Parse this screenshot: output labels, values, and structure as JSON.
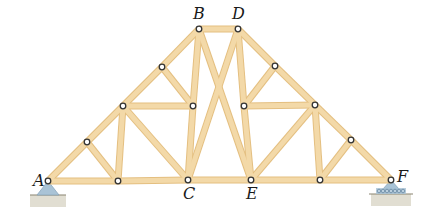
{
  "figure": {
    "type": "truss",
    "colors": {
      "member_fill": "#f3d9a8",
      "member_edge": "#e4bf80",
      "pin_stroke": "#333333",
      "pin_fill": "#ffffff",
      "support_fill": "#a9c3d6",
      "ground": "#c9c3ad",
      "roller": "#6f8ea8"
    },
    "labels": [
      {
        "id": "A",
        "text": "A",
        "x": 33,
        "y": 173
      },
      {
        "id": "B",
        "text": "B",
        "x": 193,
        "y": 6
      },
      {
        "id": "D",
        "text": "D",
        "x": 232,
        "y": 6
      },
      {
        "id": "C",
        "text": "C",
        "x": 183,
        "y": 186
      },
      {
        "id": "E",
        "text": "E",
        "x": 246,
        "y": 186
      },
      {
        "id": "F",
        "text": "F",
        "x": 397,
        "y": 169
      }
    ],
    "nodes": {
      "A": [
        48,
        181
      ],
      "n1": [
        87,
        142
      ],
      "n2": [
        123,
        106
      ],
      "n3": [
        162,
        67
      ],
      "B": [
        199,
        29
      ],
      "D": [
        238,
        29
      ],
      "n4": [
        275,
        66
      ],
      "n5": [
        315,
        105
      ],
      "n6": [
        351,
        140
      ],
      "F": [
        391,
        180
      ],
      "m1": [
        193,
        106
      ],
      "m2": [
        244,
        106
      ],
      "b1": [
        118,
        181
      ],
      "C": [
        188,
        180
      ],
      "E": [
        251,
        180
      ],
      "b2": [
        320,
        180
      ]
    },
    "members": [
      [
        "A",
        "n1"
      ],
      [
        "n1",
        "n2"
      ],
      [
        "n2",
        "n3"
      ],
      [
        "n3",
        "B"
      ],
      [
        "B",
        "D"
      ],
      [
        "D",
        "n4"
      ],
      [
        "n4",
        "n5"
      ],
      [
        "n5",
        "n6"
      ],
      [
        "n6",
        "F"
      ],
      [
        "A",
        "b1"
      ],
      [
        "b1",
        "C"
      ],
      [
        "C",
        "E"
      ],
      [
        "E",
        "b2"
      ],
      [
        "b2",
        "F"
      ],
      [
        "n1",
        "b1"
      ],
      [
        "n2",
        "b1"
      ],
      [
        "n2",
        "C"
      ],
      [
        "n2",
        "m1"
      ],
      [
        "n3",
        "m1"
      ],
      [
        "B",
        "m1"
      ],
      [
        "m1",
        "C"
      ],
      [
        "B",
        "E"
      ],
      [
        "D",
        "C"
      ],
      [
        "D",
        "m2"
      ],
      [
        "m2",
        "E"
      ],
      [
        "n4",
        "m2"
      ],
      [
        "m2",
        "n5"
      ],
      [
        "n5",
        "E"
      ],
      [
        "n5",
        "b2"
      ],
      [
        "n6",
        "b2"
      ]
    ],
    "supports": [
      {
        "id": "support-A",
        "kind": "pin",
        "node": "A"
      },
      {
        "id": "support-F",
        "kind": "roller",
        "node": "F"
      }
    ]
  }
}
